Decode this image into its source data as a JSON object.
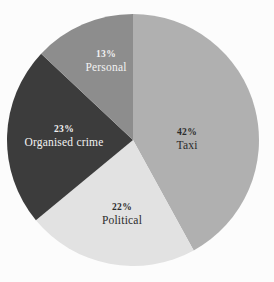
{
  "chart_data": {
    "type": "pie",
    "title": "",
    "subtitle": "",
    "xlabel": "",
    "ylabel": "",
    "legend": "none",
    "grid": false,
    "start_angle_deg": 0,
    "direction": "clockwise",
    "categories": [
      "Taxi",
      "Political",
      "Organised crime",
      "Personal"
    ],
    "values": [
      42,
      22,
      23,
      13
    ],
    "unit": "%",
    "slices": [
      {
        "label": "Taxi",
        "value": 42,
        "percent_text": "42%",
        "color": "#b0b0b0",
        "text_color": "#2b2b2b",
        "start_deg": 0,
        "end_deg": 151.2
      },
      {
        "label": "Political",
        "value": 22,
        "percent_text": "22%",
        "color": "#e2e2e2",
        "text_color": "#2b2b2b",
        "start_deg": 151.2,
        "end_deg": 230.4
      },
      {
        "label": "Organised crime",
        "value": 23,
        "percent_text": "23%",
        "color": "#3c3c3c",
        "text_color": "#f2f2f2",
        "start_deg": 230.4,
        "end_deg": 313.2
      },
      {
        "label": "Personal",
        "value": 13,
        "percent_text": "13%",
        "color": "#8d8d8d",
        "text_color": "#f2f2f2",
        "start_deg": 313.2,
        "end_deg": 360
      }
    ],
    "geometry": {
      "center_x": 133,
      "center_y": 140,
      "radius": 126
    },
    "colors": {
      "background": "#fcfcfc",
      "taxi": "#b0b0b0",
      "political": "#e2e2e2",
      "organised_crime": "#3c3c3c",
      "personal": "#8d8d8d"
    }
  }
}
